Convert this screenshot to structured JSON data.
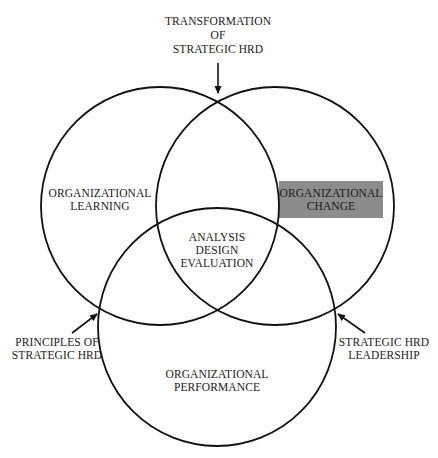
{
  "diagram": {
    "type": "venn",
    "circles": [
      {
        "id": "learning",
        "label_lines": [
          "ORGANIZATIONAL",
          "LEARNING"
        ]
      },
      {
        "id": "change",
        "label_lines": [
          "ORGANIZATIONAL",
          "CHANGE"
        ],
        "highlighted": true,
        "highlight_color": "#8c8c8c"
      },
      {
        "id": "performance",
        "label_lines": [
          "ORGANIZATIONAL",
          "PERFORMANCE"
        ]
      }
    ],
    "center": {
      "label_lines": [
        "ANALYSIS",
        "DESIGN",
        "EVALUATION"
      ]
    },
    "annotations": {
      "top": {
        "label_lines": [
          "TRANSFORMATION",
          "OF",
          "STRATEGIC HRD"
        ],
        "arrow_target": "learning-change intersection"
      },
      "left": {
        "label_lines": [
          "PRINCIPLES OF",
          "STRATEGIC HRD"
        ],
        "arrow_target": "learning-performance intersection"
      },
      "right": {
        "label_lines": [
          "STRATEGIC HRD",
          "LEADERSHIP"
        ],
        "arrow_target": "change-performance intersection"
      }
    }
  }
}
